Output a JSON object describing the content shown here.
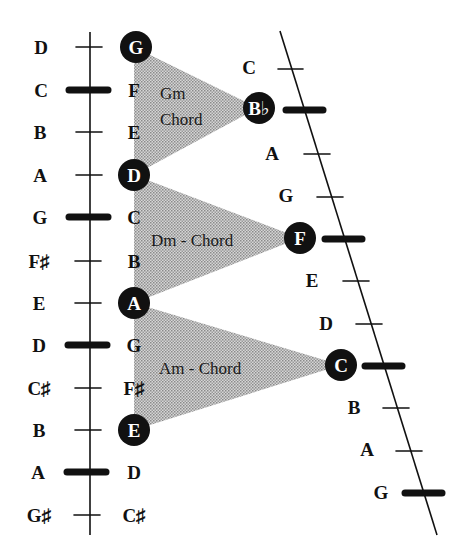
{
  "diagram": {
    "type": "music-theory-scale-chord-diagram",
    "colors": {
      "ink": "#111111",
      "triangle_fill": "#b8b8b8",
      "background": "#ffffff"
    },
    "left_scale": {
      "notes": [
        {
          "label": "D",
          "thick": false
        },
        {
          "label": "C",
          "thick": true
        },
        {
          "label": "B",
          "thick": false
        },
        {
          "label": "A",
          "thick": false
        },
        {
          "label": "G",
          "thick": true
        },
        {
          "label": "F♯",
          "thick": false
        },
        {
          "label": "E",
          "thick": false
        },
        {
          "label": "D",
          "thick": true
        },
        {
          "label": "C♯",
          "thick": false
        },
        {
          "label": "B",
          "thick": false
        },
        {
          "label": "A",
          "thick": true
        },
        {
          "label": "G♯",
          "thick": false
        }
      ]
    },
    "middle_column": {
      "notes": [
        {
          "label": "G",
          "circled": true
        },
        {
          "label": "F",
          "circled": false
        },
        {
          "label": "E",
          "circled": false
        },
        {
          "label": "D",
          "circled": true
        },
        {
          "label": "C",
          "circled": false
        },
        {
          "label": "B",
          "circled": false
        },
        {
          "label": "A",
          "circled": true
        },
        {
          "label": "G",
          "circled": false
        },
        {
          "label": "F♯",
          "circled": false
        },
        {
          "label": "E",
          "circled": true
        },
        {
          "label": "D",
          "circled": false
        },
        {
          "label": "C♯",
          "circled": false
        }
      ]
    },
    "right_scale": {
      "notes": [
        {
          "label": "C",
          "circled": false,
          "thick": false
        },
        {
          "label": "B♭",
          "circled": true,
          "thick": true
        },
        {
          "label": "A",
          "circled": false,
          "thick": false
        },
        {
          "label": "G",
          "circled": false,
          "thick": false
        },
        {
          "label": "F",
          "circled": true,
          "thick": true
        },
        {
          "label": "E",
          "circled": false,
          "thick": false
        },
        {
          "label": "D",
          "circled": false,
          "thick": false
        },
        {
          "label": "C",
          "circled": true,
          "thick": true
        },
        {
          "label": "B",
          "circled": false,
          "thick": false
        },
        {
          "label": "A",
          "circled": false,
          "thick": false
        },
        {
          "label": "G",
          "circled": false,
          "thick": true
        }
      ]
    },
    "chords": [
      {
        "name_line1": "Gm",
        "name_line2": "Chord",
        "from": "G",
        "to": "D",
        "apex": "B♭"
      },
      {
        "name_line1": "Dm - Chord",
        "name_line2": "",
        "from": "D",
        "to": "A",
        "apex": "F"
      },
      {
        "name_line1": "Am - Chord",
        "name_line2": "",
        "from": "A",
        "to": "E",
        "apex": "C"
      }
    ]
  }
}
